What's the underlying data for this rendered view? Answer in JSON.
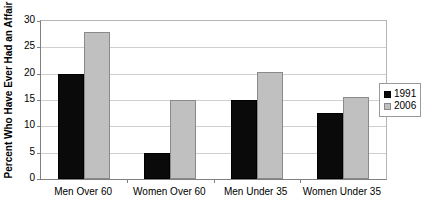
{
  "chart_data": {
    "type": "bar",
    "title": "",
    "xlabel": "",
    "ylabel": "Percent Who Have Ever Had an Affair",
    "ylim": [
      0,
      30
    ],
    "yticks": [
      0,
      5,
      10,
      15,
      20,
      25,
      30
    ],
    "ytick_labels": [
      "0",
      "5",
      "10",
      "15",
      "20",
      "25",
      "30"
    ],
    "grid": true,
    "legend_position": "right",
    "categories": [
      "Men Over 60",
      "Women Over 60",
      "Men Under 35",
      "Women Under 35"
    ],
    "series": [
      {
        "name": "1991",
        "color": "#0a0a0a",
        "values": [
          20,
          5,
          15,
          12.5
        ]
      },
      {
        "name": "2006",
        "color": "#c0c0c0",
        "values": [
          28,
          15,
          20.3,
          15.5
        ]
      }
    ]
  },
  "legend": {
    "entries": [
      {
        "label": "1991",
        "swatch": "legend-swatch-1991"
      },
      {
        "label": "2006",
        "swatch": "legend-swatch-2006"
      }
    ]
  }
}
